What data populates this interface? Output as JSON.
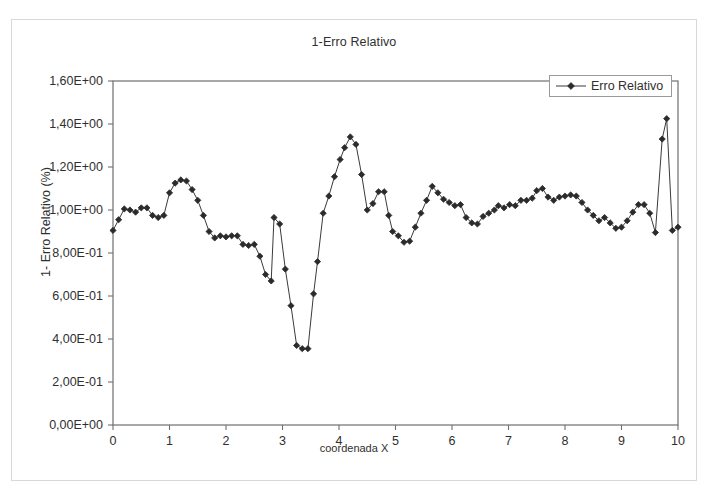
{
  "chart_data": {
    "type": "line",
    "title": "1-Erro Relativo",
    "xlabel": "coordenada X",
    "ylabel": "1- Erro Relativo (%)",
    "xlim": [
      0,
      10
    ],
    "ylim": [
      0,
      1.6
    ],
    "grid": false,
    "legend": {
      "position": "top-right",
      "entries": [
        "Erro Relativo"
      ]
    },
    "xticks": [
      "0",
      "1",
      "2",
      "3",
      "4",
      "5",
      "6",
      "7",
      "8",
      "9",
      "10"
    ],
    "xtick_values": [
      0,
      1,
      2,
      3,
      4,
      5,
      6,
      7,
      8,
      9,
      10
    ],
    "yticks": [
      "0,00E+00",
      "2,00E-01",
      "4,00E-01",
      "6,00E-01",
      "8,00E-01",
      "1,00E+00",
      "1,20E+00",
      "1,40E+00",
      "1,60E+00"
    ],
    "ytick_values": [
      0,
      0.2,
      0.4,
      0.6,
      0.8,
      1.0,
      1.2,
      1.4,
      1.6
    ],
    "marker": "diamond",
    "line_color": "#3a3a3a",
    "marker_color": "#2b2b2b",
    "series": [
      {
        "name": "Erro Relativo",
        "x": [
          0.0,
          0.1,
          0.2,
          0.3,
          0.4,
          0.5,
          0.6,
          0.7,
          0.8,
          0.9,
          1.0,
          1.1,
          1.2,
          1.3,
          1.4,
          1.5,
          1.6,
          1.7,
          1.8,
          1.9,
          2.0,
          2.1,
          2.2,
          2.3,
          2.4,
          2.5,
          2.6,
          2.7,
          2.8,
          2.85,
          2.95,
          3.05,
          3.15,
          3.25,
          3.35,
          3.45,
          3.55,
          3.62,
          3.72,
          3.82,
          3.92,
          4.02,
          4.1,
          4.2,
          4.3,
          4.4,
          4.5,
          4.6,
          4.7,
          4.8,
          4.88,
          4.95,
          5.05,
          5.15,
          5.25,
          5.35,
          5.45,
          5.55,
          5.65,
          5.75,
          5.85,
          5.95,
          6.05,
          6.15,
          6.25,
          6.35,
          6.45,
          6.55,
          6.65,
          6.75,
          6.82,
          6.92,
          7.02,
          7.12,
          7.22,
          7.32,
          7.42,
          7.5,
          7.6,
          7.7,
          7.8,
          7.9,
          8.0,
          8.1,
          8.2,
          8.3,
          8.4,
          8.5,
          8.6,
          8.7,
          8.8,
          8.9,
          9.0,
          9.1,
          9.2,
          9.3,
          9.4,
          9.5,
          9.6,
          9.72,
          9.8,
          9.9,
          10.0
        ],
        "y": [
          0.905,
          0.955,
          1.005,
          1.0,
          0.99,
          1.01,
          1.01,
          0.975,
          0.965,
          0.975,
          1.08,
          1.125,
          1.14,
          1.135,
          1.095,
          1.045,
          0.975,
          0.9,
          0.87,
          0.88,
          0.875,
          0.88,
          0.88,
          0.84,
          0.835,
          0.84,
          0.785,
          0.7,
          0.67,
          0.965,
          0.935,
          0.725,
          0.555,
          0.37,
          0.355,
          0.355,
          0.61,
          0.76,
          0.985,
          1.065,
          1.155,
          1.235,
          1.29,
          1.34,
          1.305,
          1.165,
          1.0,
          1.03,
          1.085,
          1.085,
          0.975,
          0.9,
          0.88,
          0.85,
          0.855,
          0.92,
          0.985,
          1.045,
          1.11,
          1.08,
          1.05,
          1.035,
          1.02,
          1.025,
          0.965,
          0.94,
          0.935,
          0.97,
          0.985,
          1.0,
          1.02,
          1.01,
          1.025,
          1.02,
          1.045,
          1.045,
          1.055,
          1.09,
          1.1,
          1.06,
          1.045,
          1.06,
          1.065,
          1.07,
          1.065,
          1.035,
          1.0,
          0.975,
          0.95,
          0.965,
          0.94,
          0.915,
          0.92,
          0.95,
          0.99,
          1.025,
          1.025,
          0.985,
          0.895,
          1.33,
          1.425,
          0.905,
          0.92
        ]
      }
    ]
  }
}
